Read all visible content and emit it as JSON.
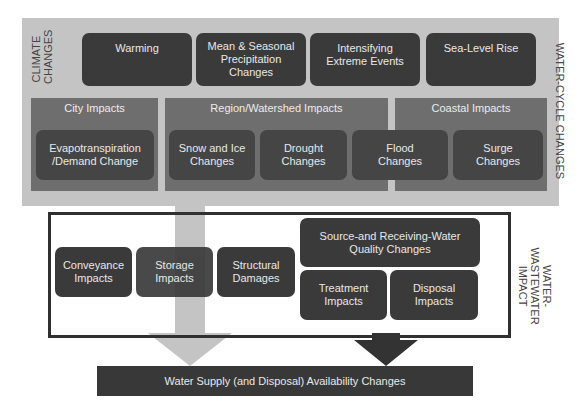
{
  "diagram": {
    "climate_changes": {
      "label": "CLIMATE\nCHANGES",
      "items": [
        {
          "label": "Warming"
        },
        {
          "label": "Mean & Seasonal\nPrecipitation\nChanges"
        },
        {
          "label": "Intensifying\nExtreme Events"
        },
        {
          "label": "Sea-Level Rise"
        }
      ]
    },
    "water_cycle_label": "WATER-CYCLE CHANGES",
    "panels": [
      {
        "title": "City Impacts"
      },
      {
        "title": "Region/Watershed Impacts"
      },
      {
        "title": "Coastal Impacts"
      }
    ],
    "impacts": [
      {
        "label": "Evapotranspiration\n/Demand Change"
      },
      {
        "label": "Snow and Ice\nChanges"
      },
      {
        "label": "Drought\nChanges"
      },
      {
        "label": "Flood\nChanges"
      },
      {
        "label": "Surge\nChanges"
      }
    ],
    "water_wastewater": {
      "label": "WATER-\nWASTEWATER\nIMPACT",
      "items": [
        {
          "label": "Conveyance\nImpacts"
        },
        {
          "label": "Storage\nImpacts"
        },
        {
          "label": "Structural\nDamages"
        },
        {
          "label": "Source-and Receiving-Water\nQuality Changes"
        },
        {
          "label": "Treatment\nImpacts"
        },
        {
          "label": "Disposal\nImpacts"
        }
      ]
    },
    "result": {
      "label": "Water Supply (and Disposal) Availability Changes"
    },
    "colors": {
      "outer_bg": "#c4c4c4",
      "panel_bg": "#6e6e6e",
      "box_bg": "#3a3a3a",
      "light_arrow": "#c4c4c4",
      "dark_arrow": "#333333"
    }
  }
}
